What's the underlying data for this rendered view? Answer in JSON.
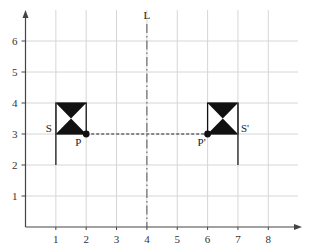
{
  "diagram": {
    "type": "coordinate-grid-reflection",
    "x_axis": {
      "ticks": [
        "1",
        "2",
        "3",
        "4",
        "5",
        "6",
        "7",
        "8"
      ]
    },
    "y_axis": {
      "ticks": [
        "1",
        "2",
        "3",
        "4",
        "5",
        "6"
      ]
    },
    "mirror_line": {
      "label": "L",
      "x": 4,
      "style": "dash-dot"
    },
    "shapes": [
      {
        "label": "S",
        "pole_x": 1,
        "pole_from_y": 2,
        "pole_to_y": 4,
        "flag_from_x": 1,
        "flag_to_x": 2,
        "flag_from_y": 3,
        "flag_to_y": 4
      },
      {
        "label": "S'",
        "pole_x": 7,
        "pole_from_y": 2,
        "pole_to_y": 4,
        "flag_from_x": 6,
        "flag_to_x": 7,
        "flag_from_y": 3,
        "flag_to_y": 4
      }
    ],
    "points": [
      {
        "label": "P",
        "x": 2,
        "y": 3
      },
      {
        "label": "P'",
        "x": 6,
        "y": 3
      }
    ],
    "connector": {
      "from": "P",
      "to": "P'",
      "style": "dotted"
    },
    "colors": {
      "grid": "#d6d6d6",
      "axis": "#444444",
      "shape_fill": "#111111",
      "text": "#333333"
    }
  }
}
